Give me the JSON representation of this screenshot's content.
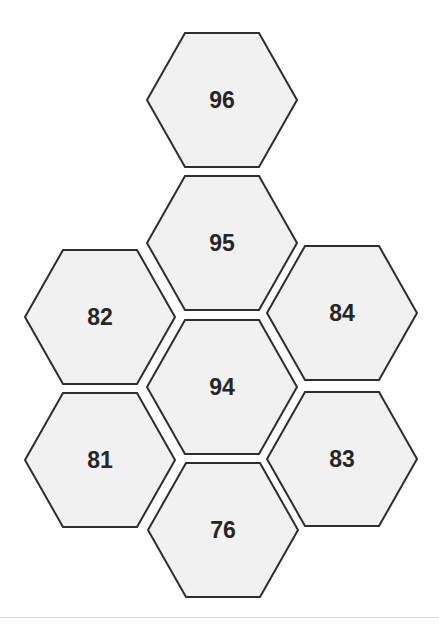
{
  "diagram": {
    "type": "hexagon-grid",
    "colors": {
      "fill": "#f1f1f1",
      "stroke": "#2e2e2e",
      "text": "#262626",
      "background": "#ffffff"
    },
    "hex_size": {
      "half_width": 75,
      "half_height": 67,
      "top_inset": 38
    },
    "hexagons": [
      {
        "id": "hex-96",
        "label": "96",
        "cx": 222,
        "cy": 100
      },
      {
        "id": "hex-95",
        "label": "95",
        "cx": 222,
        "cy": 243
      },
      {
        "id": "hex-82",
        "label": "82",
        "cx": 100,
        "cy": 317
      },
      {
        "id": "hex-84",
        "label": "84",
        "cx": 342,
        "cy": 313
      },
      {
        "id": "hex-94",
        "label": "94",
        "cx": 222,
        "cy": 387
      },
      {
        "id": "hex-81",
        "label": "81",
        "cx": 100,
        "cy": 460
      },
      {
        "id": "hex-83",
        "label": "83",
        "cx": 342,
        "cy": 459
      },
      {
        "id": "hex-76",
        "label": "76",
        "cx": 223,
        "cy": 530
      }
    ]
  }
}
